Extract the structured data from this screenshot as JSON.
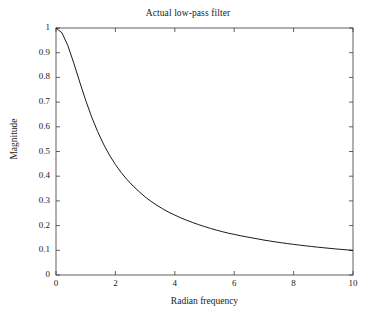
{
  "chart_data": {
    "type": "line",
    "title": "Actual low-pass filter",
    "xlabel": "Radian frequency",
    "ylabel": "Magnitude",
    "xlim": [
      0,
      10
    ],
    "ylim": [
      0,
      1
    ],
    "grid": false,
    "legend": null,
    "xticks": [
      "0",
      "2",
      "4",
      "6",
      "8",
      "10"
    ],
    "xtick_values": [
      0,
      2,
      4,
      6,
      8,
      10
    ],
    "yticks": [
      "0",
      "0.1",
      "0.2",
      "0.3",
      "0.4",
      "0.5",
      "0.6",
      "0.7",
      "0.8",
      "0.9",
      "1"
    ],
    "ytick_values": [
      0,
      0.1,
      0.2,
      0.3,
      0.4,
      0.5,
      0.6,
      0.7,
      0.8,
      0.9,
      1
    ],
    "series": [
      {
        "name": "Magnitude response",
        "color": "#000000",
        "x": [
          0,
          0.2,
          0.4,
          0.6,
          0.8,
          1,
          1.2,
          1.4,
          1.6,
          1.8,
          2,
          2.2,
          2.4,
          2.6,
          2.8,
          3,
          3.2,
          3.4,
          3.6,
          3.8,
          4,
          4.2,
          4.4,
          4.6,
          4.8,
          5,
          5.2,
          5.4,
          5.6,
          5.8,
          6,
          6.2,
          6.4,
          6.6,
          6.8,
          7,
          7.2,
          7.4,
          7.6,
          7.8,
          8,
          8.2,
          8.4,
          8.6,
          8.8,
          9,
          9.2,
          9.4,
          9.6,
          9.8,
          10
        ],
        "y": [
          1,
          0.9806,
          0.9285,
          0.8575,
          0.7809,
          0.7071,
          0.6402,
          0.5812,
          0.5298,
          0.4856,
          0.4472,
          0.414,
          0.3851,
          0.3597,
          0.3373,
          0.3162,
          0.2981,
          0.282,
          0.2673,
          0.254,
          0.2425,
          0.2315,
          0.2217,
          0.2126,
          0.204,
          0.1961,
          0.1887,
          0.1818,
          0.1754,
          0.1695,
          0.1644,
          0.1594,
          0.1547,
          0.1502,
          0.146,
          0.1414,
          0.1376,
          0.1339,
          0.1304,
          0.1271,
          0.124,
          0.121,
          0.1182,
          0.1155,
          0.1129,
          0.1104,
          0.1081,
          0.1058,
          0.1037,
          0.1016,
          0.0995
        ]
      }
    ]
  }
}
